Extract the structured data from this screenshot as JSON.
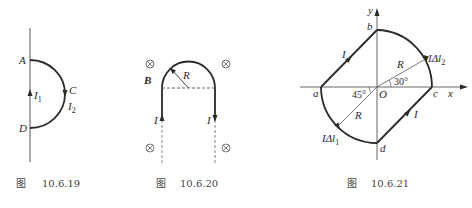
{
  "figures": [
    {
      "caption_prefix": "图",
      "caption_number": "10.6.19",
      "labels": {
        "A": "A",
        "C": "C",
        "D": "D",
        "I1": "I",
        "I1_sub": "1",
        "I2": "I",
        "I2_sub": "2"
      }
    },
    {
      "caption_prefix": "图",
      "caption_number": "10.6.20",
      "labels": {
        "B": "B",
        "R": "R",
        "I_left": "I",
        "I_right": "I",
        "field_symbol": "⊗"
      }
    },
    {
      "caption_prefix": "图",
      "caption_number": "10.6.21",
      "labels": {
        "x": "x",
        "y": "y",
        "O": "O",
        "a": "a",
        "b": "b",
        "c": "c",
        "d": "d",
        "R_upper": "R",
        "R_lower": "R",
        "angle_30": "30°",
        "angle_45": "45°",
        "I_ab": "I",
        "I_dc": "I",
        "IdI1": "IΔl",
        "IdI1_sub": "1",
        "IdI2": "IΔl",
        "IdI2_sub": "2"
      }
    }
  ],
  "colors": {
    "line": "#2a2a2a",
    "thin_line": "#555555",
    "caption": "#444444"
  }
}
